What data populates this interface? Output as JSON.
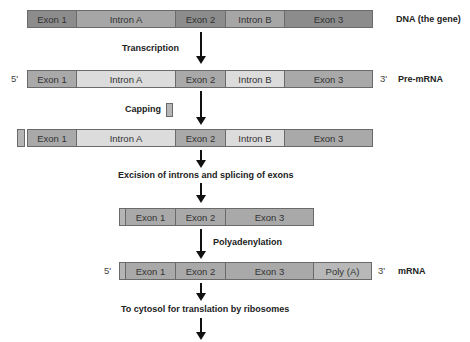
{
  "colors": {
    "dna_exon": "#8c8c8c",
    "dna_intron": "#a6a6a6",
    "rna_exon": "#a9a9a9",
    "rna_intron": "#dcdcdc",
    "cap": "#b5b5b5",
    "polya": "#b8b8b8"
  },
  "rows": {
    "dna": {
      "segments": [
        "Exon 1",
        "Intron A",
        "Exon 2",
        "Intron B",
        "Exon 3"
      ],
      "label": "DNA (the gene)"
    },
    "pre_mrna": {
      "five_prime": "5'",
      "segments": [
        "Exon 1",
        "Intron A",
        "Exon 2",
        "Intron B",
        "Exon 3"
      ],
      "three_prime": "3'",
      "label": "Pre-mRNA"
    },
    "capped": {
      "segments": [
        "Exon 1",
        "Intron A",
        "Exon 2",
        "Intron B",
        "Exon 3"
      ]
    },
    "spliced": {
      "segments": [
        "Exon 1",
        "Exon 2",
        "Exon 3"
      ]
    },
    "mrna": {
      "five_prime": "5'",
      "segments": [
        "Exon 1",
        "Exon 2",
        "Exon 3",
        "Poly (A)"
      ],
      "three_prime": "3'",
      "label": "mRNA"
    }
  },
  "steps": {
    "transcription": "Transcription",
    "capping": "Capping",
    "splicing": "Excision of introns and splicing of exons",
    "polyadenylation": "Polyadenylation",
    "translation": "To cytosol for translation by ribosomes"
  }
}
